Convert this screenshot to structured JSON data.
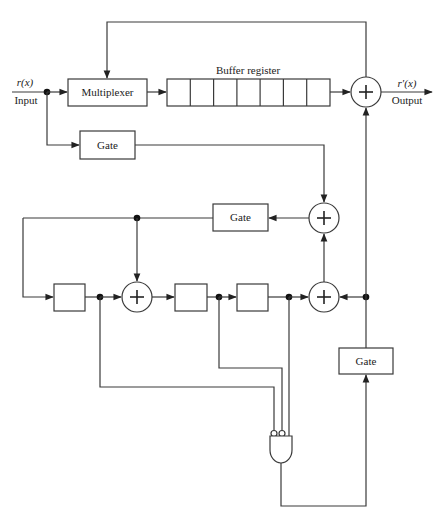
{
  "diagram": {
    "type": "block-diagram",
    "input": {
      "signal": "r(x)",
      "label": "Input"
    },
    "output": {
      "signal": "r′(x)",
      "label": "Output"
    },
    "multiplexer": {
      "label": "Multiplexer"
    },
    "buffer_register": {
      "label": "Buffer register",
      "cells": 7
    },
    "gates": [
      {
        "id": "gate-1",
        "label": "Gate"
      },
      {
        "id": "gate-2",
        "label": "Gate"
      },
      {
        "id": "gate-3",
        "label": "Gate"
      }
    ],
    "adders": [
      {
        "id": "adder-output",
        "symbol": "+"
      },
      {
        "id": "adder-feedback",
        "symbol": "+"
      },
      {
        "id": "adder-shift-1",
        "symbol": "+"
      },
      {
        "id": "adder-shift-2",
        "symbol": "+"
      }
    ],
    "shift_register": {
      "stages": 3
    },
    "and_gate": {
      "inputs": 3,
      "inverted_inputs": 2
    }
  }
}
